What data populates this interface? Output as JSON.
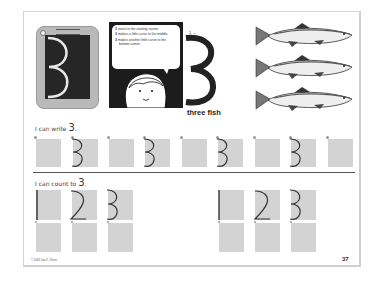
{
  "worksheet": {
    "instructions": [
      {
        "marker": "3",
        "text": "starts in the starting corner."
      },
      {
        "marker": "3",
        "text": "makes a little curve to the middle."
      },
      {
        "marker": "3",
        "text": "makes another little curve to the bottom corner."
      }
    ],
    "tablet_digit": "3",
    "big_digit": "3",
    "caption": "three fish",
    "fish_count": 3,
    "write_section": {
      "label": "I can write",
      "digit": "3",
      "period": ".",
      "boxes": [
        "",
        "3",
        "",
        "3",
        "",
        "",
        "3",
        ""
      ]
    },
    "count_section": {
      "label": "I can count to",
      "digit": "3",
      "period": ".",
      "groups": [
        {
          "top": [
            "1",
            "2",
            "3"
          ],
          "bottom": [
            "",
            "",
            ""
          ]
        },
        {
          "top": [
            "1",
            "2",
            "3"
          ],
          "bottom": [
            "",
            "",
            ""
          ]
        }
      ]
    },
    "copyright": "© 2002 Jan Z. Olsen",
    "page_number": "37"
  }
}
